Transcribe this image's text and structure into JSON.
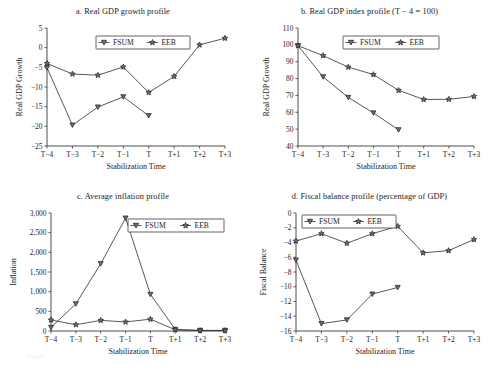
{
  "figure": {
    "categories": [
      "T−4",
      "T−3",
      "T−2",
      "T−1",
      "T",
      "T+1",
      "T+2",
      "T+3"
    ],
    "xlabel": "Stabilization Time",
    "legend": {
      "fsum": "FSUM",
      "eeb": "EEB"
    },
    "markers": {
      "fsum": "down-triangle-marker",
      "eeb": "star-marker"
    },
    "caption": "Figure"
  },
  "chart_data": [
    {
      "panel": "a",
      "type": "line",
      "title": "a. Real GDP growth profile",
      "xlabel": "Stabilization Time",
      "ylabel": "Real GDP Growth",
      "categories": [
        "T−4",
        "T−3",
        "T−2",
        "T−1",
        "T",
        "T+1",
        "T+2",
        "T+3"
      ],
      "ylim": [
        -25,
        5
      ],
      "yticks": [
        -25,
        -20,
        -15,
        -10,
        -5,
        0,
        5
      ],
      "ytick_labels": [
        "−25",
        "−20",
        "−15",
        "−10",
        "−5",
        "0",
        "5"
      ],
      "grid": false,
      "legend_position": "top-center",
      "series": [
        {
          "name": "FSUM",
          "values": [
            -5.1,
            -19.7,
            -15.1,
            -12.5,
            -17.3,
            null,
            null,
            null
          ]
        },
        {
          "name": "EEB",
          "values": [
            -4.0,
            -6.7,
            -7.0,
            -4.9,
            -11.4,
            -7.3,
            0.7,
            2.4
          ]
        }
      ]
    },
    {
      "panel": "b",
      "type": "line",
      "title": "b. Real GDP index profile (T − 4 = 100)",
      "xlabel": "Stabilization Time",
      "ylabel": "Real GDP Growth",
      "categories": [
        "T−4",
        "T−3",
        "T−2",
        "T−1",
        "T",
        "T+1",
        "T+2",
        "T+3"
      ],
      "ylim": [
        40,
        110
      ],
      "yticks": [
        40,
        50,
        60,
        70,
        80,
        90,
        100,
        110
      ],
      "ytick_labels": [
        "40",
        "50",
        "60",
        "70",
        "80",
        "90",
        "100",
        "110"
      ],
      "grid": false,
      "legend_position": "top-center",
      "series": [
        {
          "name": "FSUM",
          "values": [
            99.5,
            81.0,
            68.8,
            59.6,
            49.6,
            null,
            null,
            null
          ]
        },
        {
          "name": "EEB",
          "values": [
            99.5,
            93.6,
            86.8,
            82.4,
            73.0,
            67.6,
            67.7,
            69.4
          ]
        }
      ]
    },
    {
      "panel": "c",
      "type": "line",
      "title": "c. Average inflation profile",
      "xlabel": "Stabilization Time",
      "ylabel": "Inflation",
      "categories": [
        "T−4",
        "T−3",
        "T−2",
        "T−1",
        "T",
        "T+1",
        "T+2",
        "T+3"
      ],
      "ylim": [
        0,
        3000
      ],
      "yticks": [
        0,
        500,
        1000,
        1500,
        2000,
        2500,
        3000
      ],
      "ytick_labels": [
        "0",
        "500",
        "1,000",
        "1,500",
        "2,000",
        "2,500",
        "3,000"
      ],
      "grid": false,
      "legend_position": "top-right",
      "series": [
        {
          "name": "FSUM",
          "values": [
            90,
            690,
            1710,
            2870,
            930,
            40,
            15,
            15
          ]
        },
        {
          "name": "EEB",
          "values": [
            280,
            160,
            270,
            230,
            300,
            30,
            10,
            10
          ]
        }
      ]
    },
    {
      "panel": "d",
      "type": "line",
      "title": "d. Fiscal balance profile (percentage of GDP)",
      "xlabel": "Stabilization Time",
      "ylabel": "Fiscal Balance",
      "categories": [
        "T−4",
        "T−3",
        "T−2",
        "T−1",
        "T",
        "T+1",
        "T+2",
        "T+3"
      ],
      "ylim": [
        -16,
        0
      ],
      "yticks": [
        -16,
        -14,
        -12,
        -10,
        -8,
        -6,
        -4,
        -2,
        0
      ],
      "ytick_labels": [
        "−16",
        "−14",
        "−12",
        "−10",
        "−8",
        "−6",
        "−4",
        "−2",
        "0"
      ],
      "grid": false,
      "legend_position": "top-left",
      "series": [
        {
          "name": "FSUM",
          "values": [
            -6.4,
            -15.0,
            -14.5,
            -11.0,
            -10.1,
            null,
            null,
            null
          ]
        },
        {
          "name": "EEB",
          "values": [
            -3.8,
            -2.8,
            -4.1,
            -2.8,
            -1.8,
            -5.4,
            -5.1,
            -3.6
          ]
        }
      ]
    }
  ]
}
